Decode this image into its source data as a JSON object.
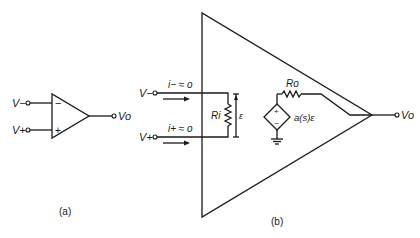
{
  "figure_a": {
    "caption": "(a)",
    "inputs": {
      "inverting": "V−",
      "noninverting": "V+"
    },
    "output": "Vo",
    "signs": {
      "minus": "−",
      "plus": "+"
    }
  },
  "figure_b": {
    "caption": "(b)",
    "inputs": {
      "inverting": "V−",
      "noninverting": "V+"
    },
    "currents": {
      "i_minus": "i− ≈ o",
      "i_plus": "i+ ≈ o"
    },
    "input_resistor": "Ri",
    "differential_voltage": "ε",
    "output_resistor": "Ro",
    "dependent_source": "a(s)ε",
    "source_signs": {
      "plus": "+",
      "minus": "−"
    },
    "output": "Vo"
  }
}
